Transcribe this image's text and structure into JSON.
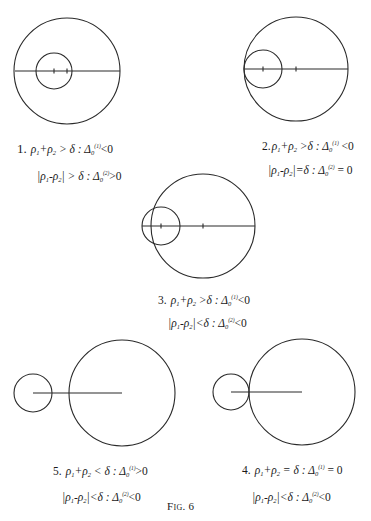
{
  "figure": {
    "label": "Fig. 6",
    "stroke_color": "#2a2a2a"
  },
  "diagrams": [
    {
      "number": "1.",
      "big_circle": {
        "cx": 67,
        "cy": 71,
        "r": 53
      },
      "small_circle": {
        "cx": 54,
        "cy": 71,
        "r": 18
      },
      "line": {
        "x1": 15,
        "x2": 120,
        "y": 71
      },
      "ticks": [
        54,
        67
      ],
      "caption": {
        "line1": {
          "lhs": "ρ₁+ρ₂ > δ",
          "rel": "Δ₀⁽¹⁾ < 0"
        },
        "line2": {
          "lhs": "|ρ₁−ρ₂| > δ",
          "rel": "Δ₀⁽²⁾ > 0"
        }
      }
    },
    {
      "number": "2.",
      "big_circle": {
        "cx": 296,
        "cy": 69,
        "r": 52
      },
      "small_circle": {
        "cx": 263,
        "cy": 69,
        "r": 19
      },
      "line": {
        "x1": 244,
        "x2": 348,
        "y": 69
      },
      "ticks": [
        263,
        296
      ],
      "caption": {
        "line1": {
          "lhs": "ρ₁+ρ₂ > δ",
          "rel": "Δ₀⁽¹⁾ < 0"
        },
        "line2": {
          "lhs": "|ρ₁−ρ₂| = δ",
          "rel": "Δ₀⁽²⁾ = 0"
        }
      }
    },
    {
      "number": "3.",
      "big_circle": {
        "cx": 203,
        "cy": 226,
        "r": 52
      },
      "small_circle": {
        "cx": 161,
        "cy": 226,
        "r": 19
      },
      "line": {
        "x1": 142,
        "x2": 255,
        "y": 226
      },
      "ticks": [
        161,
        203
      ],
      "caption": {
        "line1": {
          "lhs": "ρ₁+ρ₂ > δ",
          "rel": "Δ₀⁽¹⁾ < 0"
        },
        "line2": {
          "lhs": "|ρ₁−ρ₂| < δ",
          "rel": "Δ₀⁽²⁾ < 0"
        }
      }
    },
    {
      "number": "4.",
      "big_circle": {
        "cx": 302,
        "cy": 392,
        "r": 53
      },
      "small_circle": {
        "cx": 231,
        "cy": 392,
        "r": 18
      },
      "line": {
        "x1": 231,
        "x2": 302,
        "y": 392
      },
      "ticks": [],
      "caption": {
        "line1": {
          "lhs": "ρ₁+ρ₂ = δ",
          "rel": "Δ₀⁽¹⁾ = 0"
        },
        "line2": {
          "lhs": "|ρ₁−ρ₂| < δ",
          "rel": "Δ₀⁽²⁾ < 0"
        }
      }
    },
    {
      "number": "5.",
      "big_circle": {
        "cx": 122,
        "cy": 393,
        "r": 53
      },
      "small_circle": {
        "cx": 33,
        "cy": 393,
        "r": 19
      },
      "line": {
        "x1": 33,
        "x2": 122,
        "y": 393
      },
      "ticks": [],
      "caption": {
        "line1": {
          "lhs": "ρ₁+ρ₂ < δ",
          "rel": "Δ₀⁽¹⁾ > 0"
        },
        "line2": {
          "lhs": "|ρ₁−ρ₂| < δ",
          "rel": "Δ₀⁽²⁾ < 0"
        }
      }
    }
  ],
  "captions": {
    "c1": {
      "num": "1.",
      "l1": {
        "a": "ρ",
        "a_sub": "1",
        "op": "+",
        "b": "ρ",
        "b_sub": "2",
        "cmp": " > δ : Δ",
        "d_sub": "0",
        "d_sup": "(1)",
        "tail": "<0"
      },
      "l2": {
        "pre": "|ρ",
        "a_sub": "1",
        "op": "-ρ",
        "b_sub": "2",
        "cmp": "| > δ : Δ",
        "d_sub": "0",
        "d_sup": "(2)",
        "tail": ">0"
      }
    },
    "c2": {
      "num": "2.",
      "l1": {
        "a": "ρ",
        "a_sub": "1",
        "op": "+",
        "b": "ρ",
        "b_sub": "2",
        "cmp": " >δ : Δ",
        "d_sub": "0",
        "d_sup": "(1)",
        "tail": " <0"
      },
      "l2": {
        "pre": "|ρ",
        "a_sub": "1",
        "op": "-ρ",
        "b_sub": "2",
        "cmp": "|=δ : Δ",
        "d_sub": "0",
        "d_sup": "(2)",
        "tail": " = 0"
      }
    },
    "c3": {
      "num": "3.",
      "l1": {
        "a": "ρ",
        "a_sub": "1",
        "op": "+",
        "b": "ρ",
        "b_sub": "2",
        "cmp": " >δ : Δ",
        "d_sub": "0",
        "d_sup": "(1)",
        "tail": "<0"
      },
      "l2": {
        "pre": "|ρ",
        "a_sub": "1",
        "op": "-ρ",
        "b_sub": "2",
        "cmp": "|<δ : Δ",
        "d_sub": "0",
        "d_sup": "(2)",
        "tail": "<0"
      }
    },
    "c4": {
      "num": "4.",
      "l1": {
        "a": "ρ",
        "a_sub": "1",
        "op": "+",
        "b": "ρ",
        "b_sub": "2",
        "cmp": " = δ  : Δ",
        "d_sub": "0",
        "d_sup": "(1)",
        "tail": " = 0"
      },
      "l2": {
        "pre": "|ρ",
        "a_sub": "1",
        "op": "-ρ",
        "b_sub": "2",
        "cmp": "|<δ : Δ",
        "d_sub": "0",
        "d_sup": "(2)",
        "tail": "<0"
      }
    },
    "c5": {
      "num": "5.",
      "l1": {
        "a": "ρ",
        "a_sub": "1",
        "op": "+",
        "b": "ρ",
        "b_sub": "2",
        "cmp": " < δ : Δ",
        "d_sub": "0",
        "d_sup": "(1)",
        "tail": ">0"
      },
      "l2": {
        "pre": "|ρ",
        "a_sub": "1",
        "op": "-ρ",
        "b_sub": "2",
        "cmp": "|<δ : Δ",
        "d_sub": "0",
        "d_sup": "(2)",
        "tail": "<0"
      }
    }
  }
}
